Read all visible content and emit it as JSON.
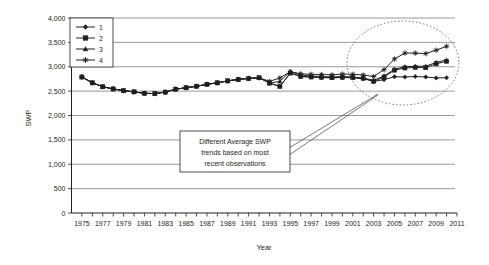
{
  "chart_data": {
    "type": "line",
    "title": "",
    "xlabel": "Year",
    "ylabel": "SWP",
    "xlim": [
      1974,
      2011
    ],
    "ylim": [
      0,
      4000
    ],
    "grid": true,
    "legend_position": "top-left",
    "ytick_labels": [
      "4,000",
      "3,500",
      "3,000",
      "2,500",
      "2,000",
      "1,500",
      "1,000",
      "500",
      "0"
    ],
    "ytick_values": [
      4000,
      3500,
      3000,
      2500,
      2000,
      1500,
      1000,
      500,
      0
    ],
    "xtick_labels": [
      "1975",
      "1977",
      "1979",
      "1981",
      "1983",
      "1985",
      "1987",
      "1989",
      "1991",
      "1993",
      "1995",
      "1997",
      "1999",
      "2001",
      "2003",
      "2005",
      "2007",
      "2009",
      "2011"
    ],
    "xtick_values": [
      1975,
      1977,
      1979,
      1981,
      1983,
      1985,
      1987,
      1989,
      1991,
      1993,
      1995,
      1997,
      1999,
      2001,
      2003,
      2005,
      2007,
      2009,
      2011
    ],
    "x": [
      1975,
      1976,
      1977,
      1978,
      1979,
      1980,
      1981,
      1982,
      1983,
      1984,
      1985,
      1986,
      1987,
      1988,
      1989,
      1990,
      1991,
      1992,
      1993,
      1994,
      1995,
      1996,
      1997,
      1998,
      1999,
      2000,
      2001,
      2002,
      2003,
      2004,
      2005,
      2006,
      2007,
      2008,
      2009,
      2010
    ],
    "series": [
      {
        "name": "1",
        "marker": "diamond",
        "values": [
          2790,
          2670,
          2590,
          2545,
          2510,
          2485,
          2455,
          2450,
          2480,
          2540,
          2570,
          2600,
          2640,
          2670,
          2710,
          2740,
          2760,
          2775,
          2665,
          2595,
          2870,
          2800,
          2790,
          2780,
          2775,
          2780,
          2775,
          2760,
          2700,
          2735,
          2795,
          2790,
          2800,
          2790,
          2770,
          2775
        ]
      },
      {
        "name": "2",
        "marker": "square",
        "values": [
          2790,
          2670,
          2590,
          2545,
          2510,
          2485,
          2455,
          2450,
          2480,
          2540,
          2570,
          2600,
          2640,
          2670,
          2710,
          2740,
          2760,
          2775,
          2665,
          2595,
          2870,
          2800,
          2790,
          2780,
          2775,
          2780,
          2775,
          2760,
          2700,
          2790,
          2930,
          2975,
          2985,
          2980,
          3060,
          3110
        ]
      },
      {
        "name": "3",
        "marker": "triangle",
        "values": [
          2790,
          2670,
          2590,
          2545,
          2510,
          2485,
          2455,
          2450,
          2480,
          2540,
          2570,
          2600,
          2640,
          2670,
          2710,
          2740,
          2760,
          2775,
          2665,
          2700,
          2900,
          2830,
          2810,
          2800,
          2790,
          2800,
          2790,
          2770,
          2720,
          2810,
          2950,
          3000,
          3010,
          3010,
          3090,
          3140
        ]
      },
      {
        "name": "4",
        "marker": "asterisk",
        "values": [
          2790,
          2670,
          2590,
          2545,
          2510,
          2485,
          2455,
          2450,
          2480,
          2540,
          2570,
          2600,
          2640,
          2670,
          2710,
          2740,
          2760,
          2775,
          2700,
          2770,
          2900,
          2855,
          2845,
          2840,
          2835,
          2850,
          2845,
          2830,
          2800,
          2940,
          3160,
          3280,
          3280,
          3270,
          3340,
          3420
        ]
      }
    ],
    "annotations": [
      {
        "id": "divergence-note",
        "text_lines": [
          "Different Average SWP",
          "trends based on most",
          "recent observations"
        ],
        "text": "Different Average SWP trends based on most recent observations"
      },
      {
        "id": "divergence-highlight",
        "shape": "dashed-ellipse",
        "description": "dashed ellipse circling the diverging trend endpoints"
      }
    ],
    "colors": {
      "line": "#231f20",
      "grid": "#6d6e71",
      "axis": "#231f20",
      "background": "#ffffff"
    }
  }
}
